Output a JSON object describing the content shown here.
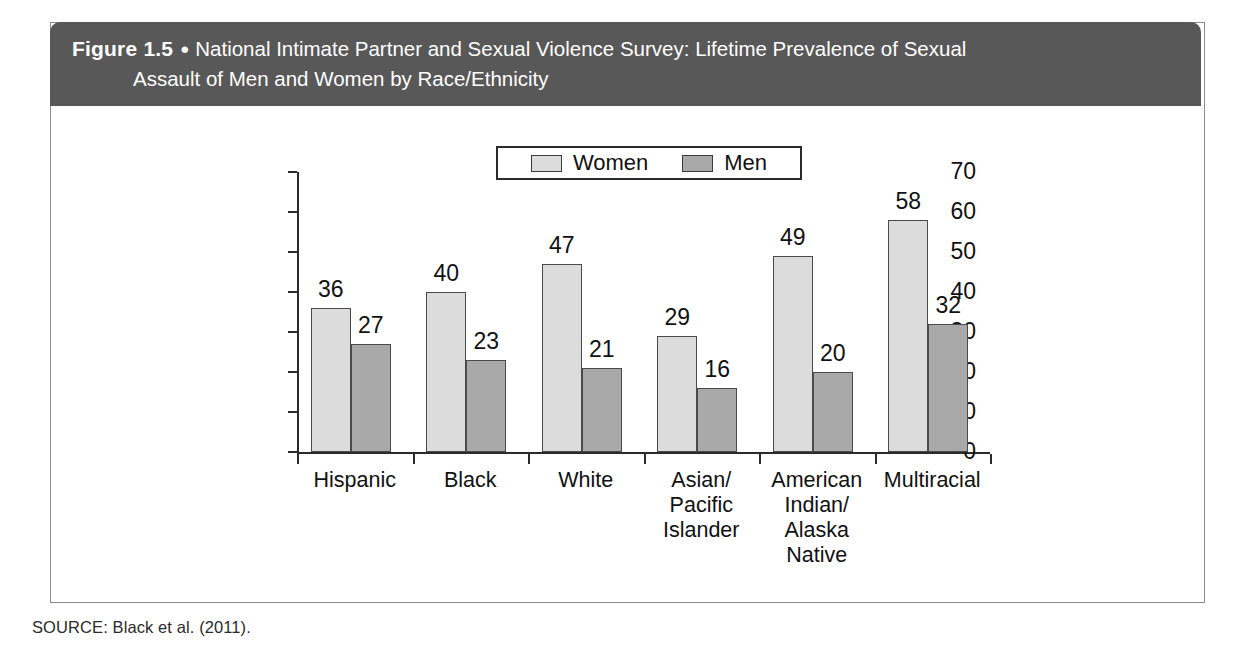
{
  "figure": {
    "number_label": "Figure 1.5",
    "bullet": "●",
    "title_line1": "National Intimate Partner and Sexual Violence Survey: Lifetime Prevalence of Sexual",
    "title_line2": "Assault of Men and Women by Race/Ethnicity",
    "source_note": "SOURCE: Black et al. (2011)."
  },
  "colors": {
    "header_background": "#585858",
    "header_text": "#ffffff",
    "women_bar": "#dcdcdc",
    "men_bar": "#a9a9a9",
    "bar_outline": "#4a4a4a",
    "axis": "#2b2b2b",
    "page_background": "#ffffff"
  },
  "chart_data": {
    "type": "bar",
    "title": "National Intimate Partner and Sexual Violence Survey: Lifetime Prevalence of Sexual Assault of Men and Women by Race/Ethnicity",
    "xlabel": "",
    "ylabel": "",
    "ylim": [
      0,
      70
    ],
    "yticks": [
      0,
      10,
      20,
      30,
      40,
      50,
      60,
      70
    ],
    "ytick_labels": [
      "0",
      "10",
      "20",
      "30",
      "40",
      "50",
      "60",
      "70"
    ],
    "grid": false,
    "legend_position": "top-center",
    "categories": [
      "Hispanic",
      "Black",
      "White",
      "Asian/\nPacific\nIslander",
      "American\nIndian/\nAlaska\nNative",
      "Multiracial"
    ],
    "series": [
      {
        "name": "Women",
        "values": [
          36,
          40,
          47,
          29,
          49,
          58
        ]
      },
      {
        "name": "Men",
        "values": [
          27,
          23,
          21,
          16,
          20,
          32
        ]
      }
    ]
  }
}
